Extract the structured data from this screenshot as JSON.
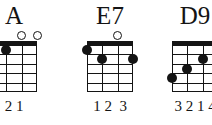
{
  "page": {
    "background_color": "#ffffff",
    "ink_color": "#141414",
    "instrument": "ukulele",
    "strings": 4,
    "frets": 5
  },
  "chords": [
    {
      "name": "A",
      "fingering_label": "2 1",
      "open_strings_label": "○○",
      "open_strings": [
        3,
        4
      ],
      "muted_strings": [],
      "dots": [
        {
          "string": 1,
          "fret": 2,
          "finger": "2"
        },
        {
          "string": 2,
          "fret": 1,
          "finger": "1"
        }
      ]
    },
    {
      "name": "E7",
      "fingering_label": "1 2  3",
      "open_strings_label": "○",
      "open_strings": [
        3
      ],
      "muted_strings": [],
      "dots": [
        {
          "string": 1,
          "fret": 1,
          "finger": "1"
        },
        {
          "string": 2,
          "fret": 2,
          "finger": "2"
        },
        {
          "string": 4,
          "fret": 2,
          "finger": "3"
        }
      ]
    },
    {
      "name": "D9",
      "fingering_label": "3 2 1 4",
      "open_strings_label": "",
      "open_strings": [],
      "muted_strings": [],
      "dots": [
        {
          "string": 1,
          "fret": 4,
          "finger": "3"
        },
        {
          "string": 2,
          "fret": 3,
          "finger": "2"
        },
        {
          "string": 3,
          "fret": 2,
          "finger": "1"
        },
        {
          "string": 4,
          "fret": 4,
          "finger": "4"
        }
      ]
    }
  ]
}
